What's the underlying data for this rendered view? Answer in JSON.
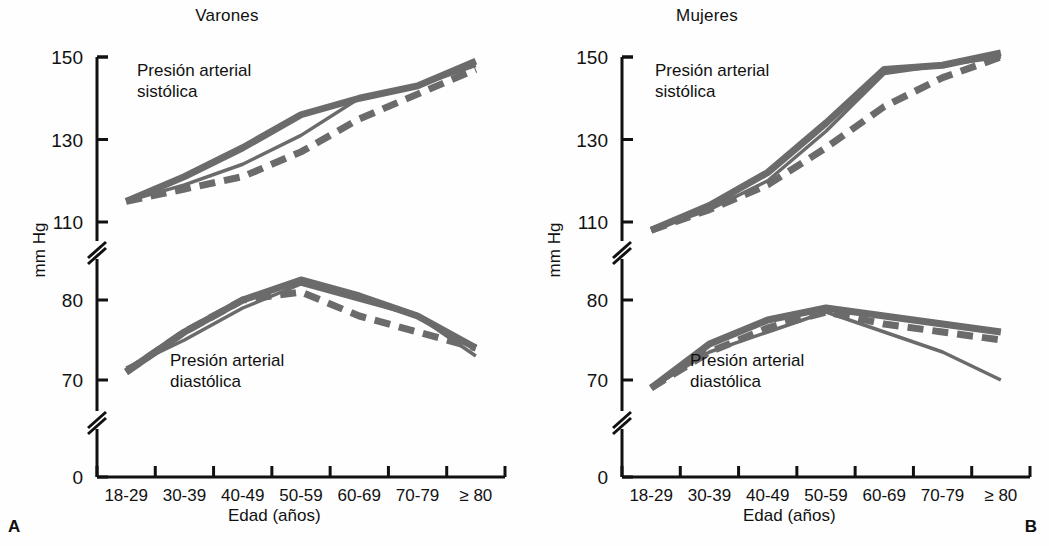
{
  "figure": {
    "panel_label_a": "A",
    "panel_label_b": "B",
    "y_axis_title": "mm Hg",
    "x_axis_title": "Edad (años)",
    "line_color": "#6b6b6b",
    "axis_color": "#111111",
    "background": "#fefefe"
  },
  "panels": [
    {
      "id": "A",
      "title": "Varones",
      "ann_systolic": "Presión arterial\nsistólica",
      "ann_diastolic": "Presión arterial\ndiastólica"
    },
    {
      "id": "B",
      "title": "Mujeres",
      "ann_systolic": "Presión arterial\nsistólica",
      "ann_diastolic": "Presión arterial\ndiastólica"
    }
  ],
  "chart_data": {
    "type": "line",
    "xlabel": "Edad (años)",
    "ylabel": "mm Hg",
    "categories": [
      "18-29",
      "30-39",
      "40-49",
      "50-59",
      "60-69",
      "70-79",
      "≥ 80"
    ],
    "y_ticks_upper": [
      110,
      130,
      150
    ],
    "y_ticks_lower": [
      70,
      80
    ],
    "y_tick_zero": 0,
    "axis_breaks": 2,
    "grid": false,
    "legend": "none",
    "panels": [
      {
        "panel": "A",
        "title": "Varones",
        "series": [
          {
            "name": "Sistólica — trazo grueso",
            "style": "solid-thick",
            "measure": "systolic",
            "values": [
              115,
              121,
              128,
              136,
              140,
              143,
              149
            ]
          },
          {
            "name": "Sistólica — trazo fino",
            "style": "solid-thin",
            "measure": "systolic",
            "values": [
              115,
              119,
              124,
              131,
              140,
              143,
              148
            ]
          },
          {
            "name": "Sistólica — trazo discontinuo",
            "style": "dashed",
            "measure": "systolic",
            "values": [
              115,
              118,
              121,
              127,
              135,
              141,
              147
            ]
          },
          {
            "name": "Diastólica — trazo grueso",
            "style": "solid-thick",
            "measure": "diastolic",
            "values": [
              71,
              76,
              80,
              82.5,
              80.5,
              78,
              74
            ]
          },
          {
            "name": "Diastólica — trazo fino",
            "style": "solid-thin",
            "measure": "diastolic",
            "values": [
              71.5,
              75,
              79,
              82,
              80,
              78,
              73
            ]
          },
          {
            "name": "Diastólica — trazo discontinuo",
            "style": "dashed",
            "measure": "diastolic",
            "values": [
              71,
              76,
              80,
              81,
              78,
              76,
              74
            ]
          }
        ]
      },
      {
        "panel": "B",
        "title": "Mujeres",
        "series": [
          {
            "name": "Sistólica — trazo grueso",
            "style": "solid-thick",
            "measure": "systolic",
            "values": [
              108,
              114,
              122,
              134,
              147,
              148,
              151
            ]
          },
          {
            "name": "Sistólica — trazo fino",
            "style": "solid-thin",
            "measure": "systolic",
            "values": [
              108,
              113,
              120,
              132,
              146,
              148,
              150
            ]
          },
          {
            "name": "Sistólica — trazo discontinuo",
            "style": "dashed",
            "measure": "systolic",
            "values": [
              108,
              113,
              119,
              128,
              138,
              145,
              150
            ]
          },
          {
            "name": "Diastólica — trazo grueso",
            "style": "solid-thick",
            "measure": "diastolic",
            "values": [
              69,
              74.5,
              77.5,
              79,
              78,
              77,
              76
            ]
          },
          {
            "name": "Diastólica — trazo fino",
            "style": "solid-thin",
            "measure": "diastolic",
            "values": [
              69,
              73.5,
              76,
              78.5,
              76,
              73.5,
              70
            ]
          },
          {
            "name": "Diastólica — trazo discontinuo",
            "style": "dashed",
            "measure": "diastolic",
            "values": [
              69,
              73.5,
              76.5,
              78.5,
              77,
              76,
              75
            ]
          }
        ]
      }
    ]
  }
}
